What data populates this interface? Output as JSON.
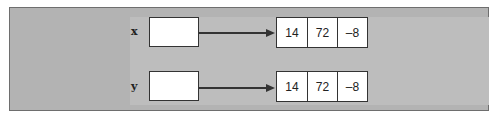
{
  "diagram": {
    "background_color": "#b3b3b3",
    "rows": [
      {
        "variable": "x",
        "values": [
          "14",
          "72",
          "–8"
        ]
      },
      {
        "variable": "y",
        "values": [
          "14",
          "72",
          "–8"
        ]
      }
    ]
  }
}
